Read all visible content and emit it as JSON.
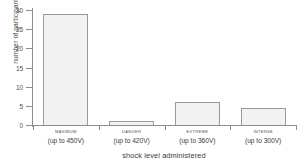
{
  "chart_data": {
    "type": "bar",
    "title": "",
    "xlabel": "shock level administered",
    "ylabel": "number of participants",
    "categories": [
      "MAXIMUM (up to 450V)",
      "DANGER (up to 420V)",
      "EXTREME (up to 360V)",
      "INTENSE (up to 300V)"
    ],
    "category_lines": [
      {
        "name": "MAXIMUM",
        "voltage": "(up to 450V)"
      },
      {
        "name": "DANGER",
        "voltage": "(up to 420V)"
      },
      {
        "name": "EXTREME",
        "voltage": "(up to 360V)"
      },
      {
        "name": "INTENSE",
        "voltage": "(up to 300V)"
      }
    ],
    "values": [
      29,
      1,
      6,
      4.5
    ],
    "ylim": [
      0,
      30
    ],
    "yticks": [
      0,
      5,
      10,
      15,
      20,
      25,
      30
    ],
    "ytick_labels": [
      "0",
      "5",
      "10",
      "15",
      "20",
      "25",
      "30"
    ],
    "grid": false,
    "legend": false,
    "bar_fill": "#f2f2f2",
    "bar_edge": "#9a9a9a",
    "axis_color": "#8e8e8e"
  }
}
